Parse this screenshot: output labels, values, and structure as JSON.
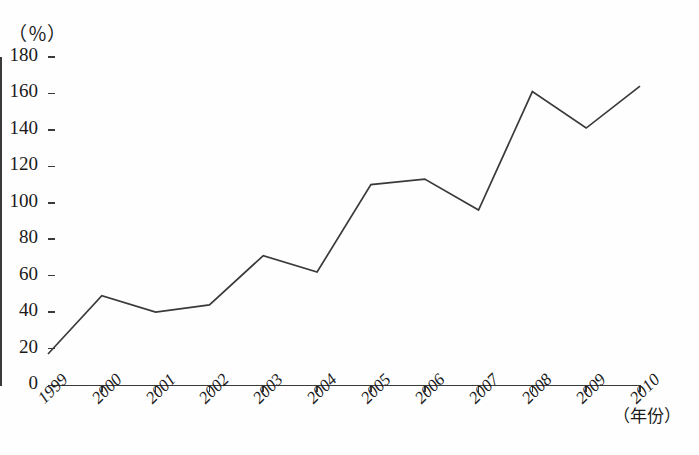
{
  "chart_data": {
    "type": "line",
    "title": "",
    "xlabel": "（年份）",
    "ylabel": "（％）",
    "categories": [
      "1999",
      "2000",
      "2001",
      "2002",
      "2003",
      "2004",
      "2005",
      "2006",
      "2007",
      "2008",
      "2009",
      "2010"
    ],
    "values": [
      17,
      49,
      40,
      44,
      71,
      62,
      110,
      113,
      96,
      161,
      141,
      164
    ],
    "series": [
      {
        "name": "",
        "values": [
          17,
          49,
          40,
          44,
          71,
          62,
          110,
          113,
          96,
          161,
          141,
          164
        ]
      }
    ],
    "ylim": [
      0,
      180
    ],
    "ytick_values": [
      0,
      20,
      40,
      60,
      80,
      100,
      120,
      140,
      160,
      180
    ],
    "ytick_labels": [
      "0",
      "20",
      "40",
      "60",
      "80",
      "100",
      "120",
      "140",
      "160",
      "180"
    ],
    "grid": false,
    "legend": "none",
    "line_color": "#3a3a3a",
    "axis_color": "#3a3a3a",
    "background_color": "#fefefe",
    "xtick_rotation": -45
  },
  "axes": {
    "y_unit": "（％）",
    "x_title": "（年份）"
  }
}
